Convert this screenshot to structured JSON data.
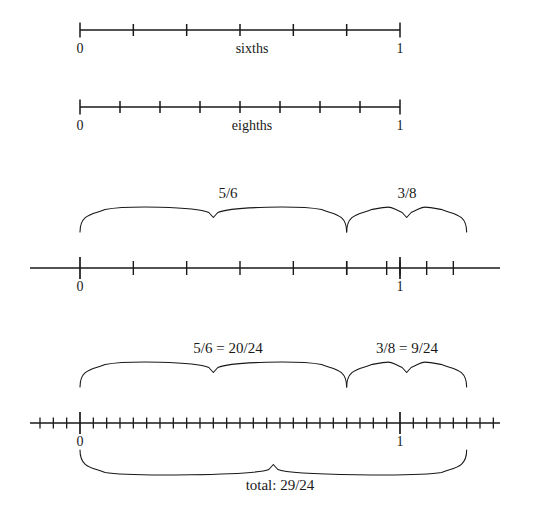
{
  "figure": {
    "type": "number-line-diagram",
    "title_text": null,
    "ink_color": "#191919",
    "background": "#ffffff"
  },
  "numberlines": [
    {
      "id": "sixths",
      "name_label": "sixths",
      "left_label": "0",
      "right_label": "1",
      "denominator": 6,
      "tick_count": 7,
      "ticks": [
        "0/6",
        "1/6",
        "2/6",
        "3/6",
        "4/6",
        "5/6",
        "6/6"
      ],
      "x_zero": 80,
      "x_one": 400,
      "line_start": 80,
      "line_end": 400,
      "y_axis": 30,
      "y_labels": 50,
      "name_label_x": 252,
      "braces": []
    },
    {
      "id": "eighths",
      "name_label": "eighths",
      "left_label": "0",
      "right_label": "1",
      "denominator": 8,
      "tick_count": 9,
      "ticks": [
        "0/8",
        "1/8",
        "2/8",
        "3/8",
        "4/8",
        "5/8",
        "6/8",
        "7/8",
        "8/8"
      ],
      "x_zero": 80,
      "x_one": 400,
      "line_start": 80,
      "line_end": 400,
      "y_axis": 107,
      "y_labels": 127,
      "name_label_x": 252,
      "braces": []
    },
    {
      "id": "sum-sixths-eighths",
      "name_label": null,
      "left_label": "0",
      "right_label": "1",
      "denominator": 6,
      "secondary_denominator": 8,
      "x_zero": 80,
      "x_one": 400,
      "line_start": 30,
      "line_end": 500,
      "y_axis": 268,
      "y_labels": 288,
      "braces": [
        {
          "label": "5/6",
          "from_value": 0,
          "to_value": 0.8333,
          "label_x": 228,
          "y_top": 207,
          "y_bottom": 232
        },
        {
          "label": "3/8",
          "from_value": 0.8333,
          "to_value": 1.2083,
          "label_x": 407,
          "y_top": 207,
          "y_bottom": 232
        }
      ]
    },
    {
      "id": "sum-twentyfourths",
      "name_label": null,
      "left_label": "0",
      "right_label": "1",
      "denominator": 24,
      "x_zero": 80,
      "x_one": 400,
      "line_start": 30,
      "line_end": 500,
      "y_axis": 423,
      "y_labels": 443,
      "braces": [
        {
          "label": "5/6 = 20/24",
          "from_value": 0,
          "to_value": 0.8333,
          "label_x": 228,
          "y_top": 362,
          "y_bottom": 387
        },
        {
          "label": "3/8 = 9/24",
          "from_value": 0.8333,
          "to_value": 1.2083,
          "label_x": 407,
          "y_top": 362,
          "y_bottom": 387
        }
      ],
      "bottom_brace": {
        "label": "total: 29/24",
        "from_value": 0,
        "to_value": 1.2083,
        "label_x": 280,
        "y_top": 450,
        "y_bottom": 475,
        "label_y": 483
      }
    }
  ],
  "texts": {
    "zero": "0",
    "one": "1",
    "sixths": "sixths",
    "eighths": "eighths",
    "five_sixths": "5/6",
    "three_eighths": "3/8",
    "five_sixths_eq": "5/6 = 20/24",
    "three_eighths_eq": "3/8 = 9/24",
    "total": "total: 29/24"
  }
}
